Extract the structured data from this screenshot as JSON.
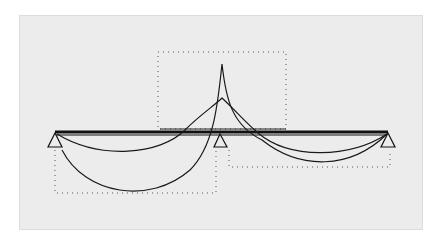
{
  "diagram": {
    "type": "continuous-beam-deflection",
    "background_color": "#ececec",
    "line_color": "#1a1a1a",
    "dotted_color": "#555555",
    "supports": [
      {
        "name": "left-support",
        "x": 55,
        "y": 133
      },
      {
        "name": "middle-support",
        "x": 220,
        "y": 133
      },
      {
        "name": "right-support",
        "x": 388,
        "y": 133
      }
    ],
    "beam": {
      "x1": 55,
      "x2": 388,
      "y": 132
    },
    "boxes": [
      {
        "name": "upper-center-box",
        "x": 158,
        "y": 52,
        "w": 128,
        "h": 77
      },
      {
        "name": "lower-left-box",
        "x": 55,
        "y": 149,
        "w": 161,
        "h": 44
      },
      {
        "name": "lower-right-box",
        "x": 228,
        "y": 151,
        "w": 162,
        "h": 16
      }
    ]
  }
}
